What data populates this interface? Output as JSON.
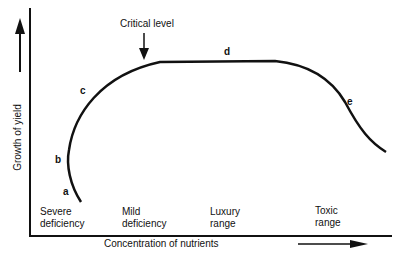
{
  "diagram": {
    "y_axis_label": "Growth of yield",
    "x_axis_label": "Concentration of nutrients",
    "annotation": "Critical level",
    "points": [
      "a",
      "b",
      "c",
      "d",
      "e"
    ],
    "ranges": [
      {
        "line1": "Severe",
        "line2": "deficiency"
      },
      {
        "line1": "Mild",
        "line2": "deficiency"
      },
      {
        "line1": "Luxury",
        "line2": "range"
      },
      {
        "line1": "Toxic",
        "line2": "range"
      }
    ]
  }
}
